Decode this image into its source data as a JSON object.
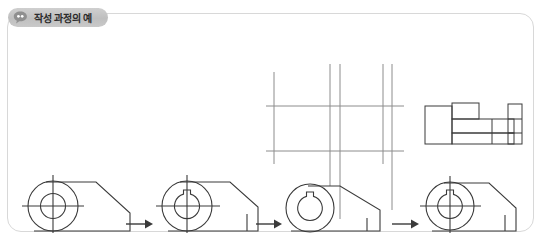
{
  "panel": {
    "tab": {
      "label": "작성 과정의 예",
      "icon": "speech-bubble-icon",
      "background_color": "#c4c4c4",
      "text_color": "#2b2b2b"
    },
    "border_color": "#d8d8d8",
    "background_color": "#ffffff"
  },
  "diagram": {
    "title": "작성 과정의 예",
    "line_color": "#3a3a3a",
    "construction_line_color": "#8c8c8c",
    "steps": [
      {
        "index": 1,
        "name": "step-1-outline",
        "label": "",
        "features": [
          "outer-circle",
          "inner-circle",
          "horizontal-centerline",
          "vertical-centerline",
          "bracket-body-outline",
          "chamfered-right-edge"
        ]
      },
      {
        "index": 2,
        "name": "step-2-keyway",
        "label": "",
        "features": [
          "outer-circle",
          "inner-circle",
          "keyway-slot-top",
          "horizontal-centerline",
          "vertical-centerline",
          "bracket-body-outline",
          "chamfered-right-edge",
          "right-vertical-face"
        ]
      },
      {
        "index": 3,
        "name": "step-3-projection",
        "label": "",
        "features": [
          "outer-circle",
          "inner-circle",
          "keyway-slot-top",
          "bracket-body-outline",
          "projection-lines-vertical",
          "projection-lines-horizontal"
        ],
        "construction": {
          "vertical_lines": 5,
          "horizontal_lines": 2
        }
      },
      {
        "index": 4,
        "name": "step-4-final",
        "label": "",
        "features": [
          "outer-circle",
          "inner-circle",
          "keyway-slot-top",
          "horizontal-centerline",
          "vertical-centerline",
          "bracket-body-outline",
          "chamfered-right-edge",
          "right-vertical-face"
        ]
      }
    ],
    "side_view": {
      "name": "side-view-projection",
      "label": "",
      "features": [
        "stepped-rectangular-profile",
        "flange-block",
        "base-plate",
        "end-boss"
      ]
    },
    "arrows": [
      {
        "name": "arrow-step1-to-step2",
        "direction": "right"
      },
      {
        "name": "arrow-step2-to-step3",
        "direction": "right"
      },
      {
        "name": "arrow-step3-to-step4",
        "direction": "right"
      }
    ]
  }
}
